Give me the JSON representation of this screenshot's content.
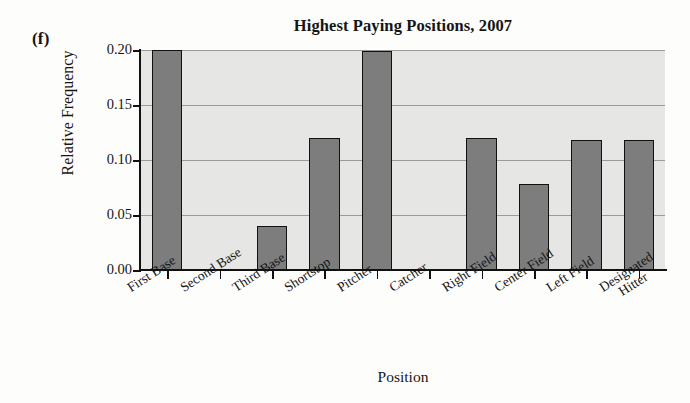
{
  "panel": {
    "letter": "(f)"
  },
  "chart_data": {
    "type": "bar",
    "title": "Highest Paying Positions, 2007",
    "xlabel": "Position",
    "ylabel": "Relative Frequency",
    "ylim": [
      0.0,
      0.2
    ],
    "yticks": [
      "0.00",
      "0.05",
      "0.10",
      "0.15",
      "0.20"
    ],
    "ytick_values": [
      0.0,
      0.05,
      0.1,
      0.15,
      0.2
    ],
    "grid": true,
    "legend": "none",
    "bar_color": "#7d7d7d",
    "bar_edge_color": "#111111",
    "plot_background": "#e6e6e4",
    "categories": [
      "First Base",
      "Second Base",
      "Third Base",
      "Shortstop",
      "Pitcher",
      "Catcher",
      "Right Field",
      "Center Field",
      "Left Field",
      "Designated Hitter"
    ],
    "category_lines": [
      [
        "First Base"
      ],
      [
        "Second Base"
      ],
      [
        "Third Base"
      ],
      [
        "Shortstop"
      ],
      [
        "Pitcher"
      ],
      [
        "Catcher"
      ],
      [
        "Right Field"
      ],
      [
        "Center Field"
      ],
      [
        "Left Field"
      ],
      [
        "Designated",
        "Hitter"
      ]
    ],
    "values": [
      0.2,
      0.0,
      0.04,
      0.12,
      0.199,
      0.0,
      0.12,
      0.078,
      0.118,
      0.118
    ]
  }
}
